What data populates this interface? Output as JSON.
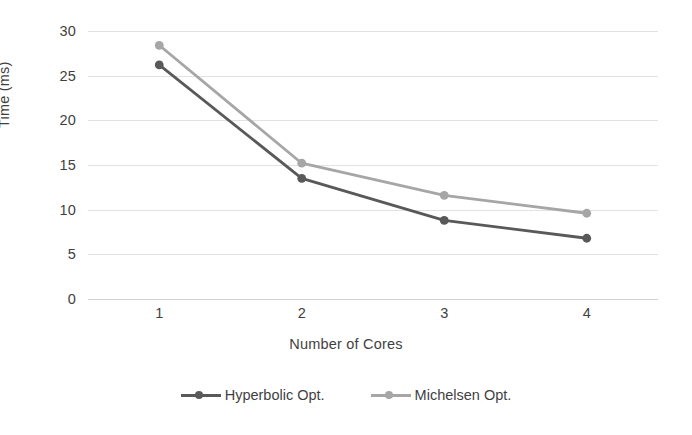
{
  "chart_data": {
    "type": "line",
    "title": "",
    "xlabel": "Number of Cores",
    "ylabel": "Time (ms)",
    "x": [
      1,
      2,
      3,
      4
    ],
    "categories": [
      "1",
      "2",
      "3",
      "4"
    ],
    "xtick_labels": [
      "1",
      "2",
      "3",
      "4"
    ],
    "ytick_labels": [
      "0",
      "5",
      "10",
      "15",
      "20",
      "25",
      "30"
    ],
    "yticks": [
      0,
      5,
      10,
      15,
      20,
      25,
      30
    ],
    "ylim": [
      0,
      30
    ],
    "xlim": [
      0.5,
      4.5
    ],
    "grid": "horizontal",
    "legend_position": "bottom",
    "series": [
      {
        "name": "Hyperbolic Opt.",
        "color": "#595959",
        "marker": "circle",
        "values": [
          26.2,
          13.5,
          8.8,
          6.8
        ]
      },
      {
        "name": "Michelsen Opt.",
        "color": "#a6a6a6",
        "marker": "circle",
        "values": [
          28.4,
          15.2,
          11.6,
          9.6
        ]
      }
    ]
  },
  "colors": {
    "series_dark": "#595959",
    "series_light": "#a6a6a6",
    "gridline": "#e2e2e2",
    "text": "#3f3f3f",
    "background": "#ffffff"
  },
  "axes": {
    "y_title": "Time (ms)",
    "x_title": "Number of Cores"
  },
  "legend": {
    "entries": [
      {
        "label": "Hyperbolic Opt."
      },
      {
        "label": "Michelsen Opt."
      }
    ]
  }
}
